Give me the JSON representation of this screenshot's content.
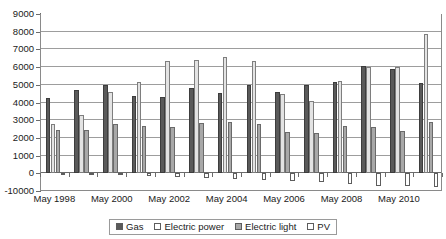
{
  "chart_data": {
    "type": "bar",
    "title": "",
    "xlabel": "",
    "ylabel": "",
    "ylim": [
      -1000,
      9000
    ],
    "ytick_labels": [
      "9000",
      "8000",
      "7000",
      "6000",
      "5000",
      "4000",
      "3000",
      "2000",
      "1000",
      "0",
      "-10000"
    ],
    "ytick_values": [
      9000,
      8000,
      7000,
      6000,
      5000,
      4000,
      3000,
      2000,
      1000,
      0,
      -1000
    ],
    "grid": true,
    "legend_position": "bottom-center",
    "categories": [
      "May 1998",
      "May 1999",
      "May 2000",
      "May 2001",
      "May 2002",
      "May 2003",
      "May 2004",
      "May 2005",
      "May 2006",
      "May 2007",
      "May 2008",
      "May 2009",
      "May 2010",
      "May 2011"
    ],
    "xtick_labels": [
      "May 1998",
      "May 2000",
      "May 2002",
      "May 2004",
      "May 2006",
      "May 2008",
      "May 2010"
    ],
    "series": [
      {
        "name": "Gas",
        "color": "#5a5a5a",
        "values": [
          4250,
          4700,
          4980,
          4380,
          4300,
          4800,
          4560,
          5000,
          4620,
          4980,
          5150,
          6050,
          5900,
          5100
        ]
      },
      {
        "name": "Electric power",
        "color": "#e3e3e3",
        "values": [
          2780,
          3320,
          4620,
          5180,
          6350,
          6380,
          6550,
          6350,
          4500,
          4100,
          5200,
          5980,
          6000,
          7880
        ]
      },
      {
        "name": "Electric light",
        "color": "#a8a8a8",
        "values": [
          2450,
          2470,
          2760,
          2700,
          2620,
          2850,
          2900,
          2780,
          2350,
          2300,
          2700,
          2600,
          2380,
          2880
        ]
      },
      {
        "name": "PV",
        "color": "#ffffff",
        "values": [
          -40,
          -60,
          -90,
          -130,
          -200,
          -280,
          -320,
          -360,
          -420,
          -470,
          -620,
          -700,
          -720,
          -760
        ]
      }
    ]
  }
}
